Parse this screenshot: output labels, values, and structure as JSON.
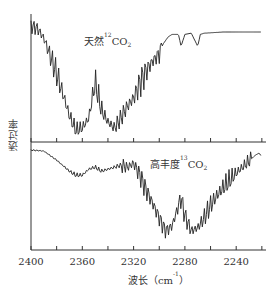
{
  "chart_data": {
    "type": "line",
    "title": "",
    "xlabel": "波长（cm⁻¹）",
    "xlabel_parts": {
      "text": "波长（cm",
      "sup": "-1",
      "close": "）"
    },
    "ylabel": "透过率",
    "xlim": [
      2400,
      2217
    ],
    "x_reversed": true,
    "xticks": [
      2400,
      2360,
      2320,
      2280,
      2240
    ],
    "minor_ticks": [
      2380,
      2340,
      2300,
      2260,
      2220
    ],
    "grid": false,
    "legend": "none (inline panel labels)",
    "panels": [
      {
        "name": "天然12CO2",
        "label": {
          "prefix": "天然",
          "sup": "12",
          "formula": "CO",
          "sub": "2"
        },
        "description": "Natural 12CO2 absorption band centered near 2349 cm-1 with rotational fine structure (P and R branches), minimum transmittance near 2365 and 2330; weak sharp dips at ~2283 and ~2270 (13CO2 natural abundance).",
        "x": [
          2400,
          2395,
          2390,
          2385,
          2380,
          2375,
          2370,
          2365,
          2360,
          2355,
          2350,
          2345,
          2340,
          2335,
          2330,
          2325,
          2320,
          2315,
          2310,
          2305,
          2300,
          2297,
          2293,
          2290,
          2285,
          2283,
          2280,
          2275,
          2270,
          2268,
          2265,
          2250,
          2240,
          2230,
          2220
        ],
        "y": [
          0.95,
          0.93,
          0.85,
          0.7,
          0.55,
          0.38,
          0.2,
          0.08,
          0.1,
          0.18,
          0.48,
          0.25,
          0.15,
          0.1,
          0.18,
          0.28,
          0.35,
          0.48,
          0.58,
          0.66,
          0.72,
          0.8,
          0.86,
          0.88,
          0.88,
          0.78,
          0.88,
          0.89,
          0.78,
          0.88,
          0.89,
          0.9,
          0.9,
          0.9,
          0.9
        ]
      },
      {
        "name": "高丰度13CO2",
        "label": {
          "prefix": "高丰度",
          "sup": "13",
          "formula": "CO",
          "sub": "2"
        },
        "description": "Enriched 13CO2 absorption band centered near 2283 cm-1 with rotational fine structure; small residual 12CO2 feature around 2360-2340.",
        "x": [
          2400,
          2390,
          2380,
          2370,
          2365,
          2360,
          2355,
          2350,
          2345,
          2340,
          2335,
          2330,
          2325,
          2320,
          2315,
          2310,
          2305,
          2300,
          2295,
          2290,
          2285,
          2283,
          2280,
          2275,
          2270,
          2265,
          2260,
          2255,
          2250,
          2245,
          2240,
          2235,
          2230,
          2225,
          2222,
          2220
        ],
        "y": [
          0.95,
          0.94,
          0.85,
          0.74,
          0.7,
          0.7,
          0.76,
          0.78,
          0.74,
          0.76,
          0.78,
          0.8,
          0.78,
          0.82,
          0.7,
          0.55,
          0.42,
          0.28,
          0.15,
          0.2,
          0.4,
          0.48,
          0.3,
          0.15,
          0.18,
          0.28,
          0.4,
          0.5,
          0.58,
          0.65,
          0.72,
          0.78,
          0.84,
          0.9,
          0.92,
          0.88
        ]
      }
    ]
  },
  "caption_partial": "(caption cut off at bottom edge)"
}
